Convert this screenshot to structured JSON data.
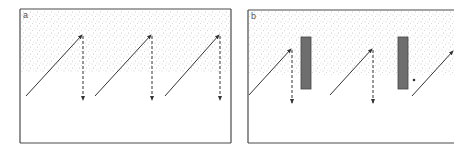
{
  "figure": {
    "panels": [
      {
        "id": "a",
        "label": "a",
        "frame": {
          "x": 20,
          "y": 9,
          "width": 211,
          "height": 134,
          "sides": [
            "top",
            "right",
            "bottom",
            "left"
          ]
        },
        "stipple_region": {
          "x": 21,
          "y": 10,
          "width": 209,
          "height": 62
        },
        "solid_arrows": [
          {
            "x1": 26,
            "y1": 96,
            "x2": 82,
            "y2": 35
          },
          {
            "x1": 95,
            "y1": 96,
            "x2": 151,
            "y2": 35
          },
          {
            "x1": 165,
            "y1": 96,
            "x2": 219,
            "y2": 35
          }
        ],
        "dashed_arrows": [
          {
            "x1": 83,
            "y1": 36,
            "x2": 83,
            "y2": 100
          },
          {
            "x1": 152,
            "y1": 36,
            "x2": 152,
            "y2": 100
          },
          {
            "x1": 220,
            "y1": 36,
            "x2": 220,
            "y2": 100
          }
        ],
        "blocks": [],
        "dots": []
      },
      {
        "id": "b",
        "label": "b",
        "frame": {
          "x": 248,
          "y": 10,
          "width": 206,
          "height": 133,
          "sides": [
            "top",
            "bottom",
            "left"
          ]
        },
        "stipple_region": {
          "x": 249,
          "y": 11,
          "width": 205,
          "height": 64
        },
        "solid_arrows": [
          {
            "x1": 249,
            "y1": 95,
            "x2": 291,
            "y2": 49
          },
          {
            "x1": 330,
            "y1": 95,
            "x2": 372,
            "y2": 49
          },
          {
            "x1": 412,
            "y1": 96,
            "x2": 453,
            "y2": 51
          }
        ],
        "dashed_arrows": [
          {
            "x1": 292,
            "y1": 50,
            "x2": 292,
            "y2": 103
          },
          {
            "x1": 373,
            "y1": 50,
            "x2": 373,
            "y2": 103
          }
        ],
        "blocks": [
          {
            "x": 301,
            "y": 37,
            "width": 10,
            "height": 52
          },
          {
            "x": 398,
            "y": 37,
            "width": 10,
            "height": 52
          }
        ],
        "dots": [
          {
            "cx": 414,
            "cy": 80,
            "r": 1.3
          }
        ]
      }
    ],
    "colors": {
      "frame": "#4a4a4a",
      "arrow": "#333333",
      "stipple": "#9a9a9a",
      "block_fill": "#6e6e6e",
      "block_stroke": "#444444",
      "background": "#ffffff"
    }
  }
}
